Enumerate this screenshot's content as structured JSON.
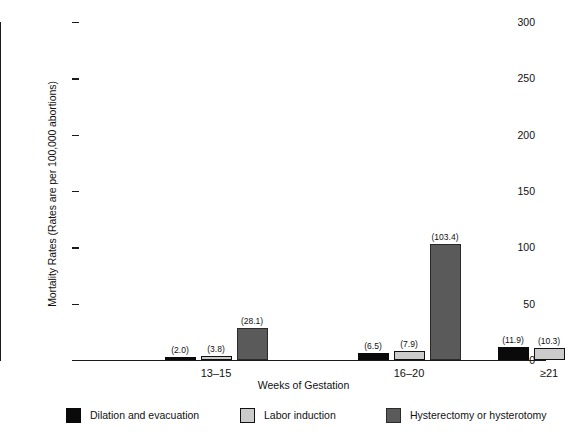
{
  "chart_data": {
    "type": "bar",
    "title": "",
    "subtitle": "",
    "xlabel": "Weeks of Gestation",
    "ylabel": "Mortality Rates (Rates are per 100,000 abortions)",
    "categories": [
      "13–15",
      "16–20",
      "≥21"
    ],
    "ylim": [
      0,
      300
    ],
    "yticks": [
      0,
      50,
      100,
      150,
      200,
      250,
      300
    ],
    "ytick_labels": [
      "0",
      "50",
      "100",
      "150",
      "200",
      "250",
      "300"
    ],
    "grid": false,
    "legend_position": "bottom",
    "series": [
      {
        "name": "Dilation and evacuation",
        "key": "dne",
        "color": "#0a0a0a",
        "values": [
          2.0,
          6.5,
          11.9
        ],
        "labels": [
          "(2.0)",
          "(6.5)",
          "(11.9)"
        ]
      },
      {
        "name": "Labor induction",
        "key": "li",
        "color": "#cbcbcb",
        "values": [
          3.8,
          7.9,
          10.3
        ],
        "labels": [
          "(3.8)",
          "(7.9)",
          "(10.3)"
        ]
      },
      {
        "name": "Hysterectomy or hysterotomy",
        "key": "hyst",
        "color": "#5a5a5a",
        "values": [
          28.1,
          103.4,
          274.3
        ],
        "labels": [
          "(28.1)",
          "(103.4)",
          "(274.3)"
        ]
      }
    ]
  },
  "axes": {
    "y_title": "Mortality Rates (Rates are per 100,000 abortions)",
    "x_title": "Weeks of Gestation"
  },
  "legend": {
    "items": [
      {
        "label": "Dilation and evacuation",
        "swatch": "dne"
      },
      {
        "label": "Labor induction",
        "swatch": "li"
      },
      {
        "label": "Hysterectomy or hysterotomy",
        "swatch": "hyst"
      }
    ]
  }
}
